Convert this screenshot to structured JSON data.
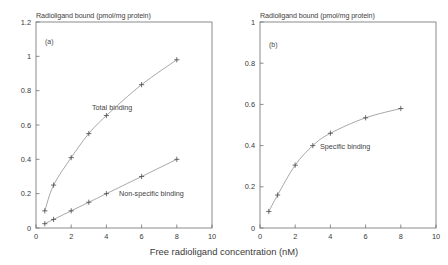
{
  "figure": {
    "xlabel": "Free radioligand concentration (nM)",
    "panels": [
      {
        "tag": "(a)",
        "ytitle": "Radioligand bound (pmol/mg protein)",
        "series_labels": [
          "Total binding",
          "Non-specific binding"
        ]
      },
      {
        "tag": "(b)",
        "ytitle": "Radioligand bound (pmol/mg protein)",
        "series_labels": [
          "Specific binding"
        ]
      }
    ]
  },
  "chart_data": [
    {
      "type": "line",
      "title": "Radioligand bound (pmol/mg protein)",
      "panel": "(a)",
      "xlabel": "Free radioligand concentration (nM)",
      "ylabel": "Radioligand bound (pmol/mg protein)",
      "xlim": [
        0,
        10
      ],
      "ylim": [
        0,
        1.2
      ],
      "xticks": [
        0,
        2,
        4,
        6,
        8,
        10
      ],
      "yticks": [
        0,
        0.2,
        0.4,
        0.6,
        0.8,
        1,
        1.2
      ],
      "xticklabels": [
        "0",
        "2",
        "4",
        "6",
        "8",
        "10"
      ],
      "yticklabels": [
        "0",
        "0.2",
        "0.4",
        "0.6",
        "0.8",
        "1",
        "1.2"
      ],
      "grid": false,
      "legend": "inline-annotation",
      "marker": "plus",
      "x": [
        0.5,
        1,
        2,
        3,
        4,
        6,
        8
      ],
      "series": [
        {
          "name": "Total binding",
          "values": [
            0.1,
            0.25,
            0.41,
            0.55,
            0.655,
            0.835,
            0.98
          ]
        },
        {
          "name": "Non-specific binding",
          "values": [
            0.025,
            0.05,
            0.1,
            0.15,
            0.2,
            0.3,
            0.4
          ]
        }
      ]
    },
    {
      "type": "line",
      "title": "Radioligand bound (pmol/mg protein)",
      "panel": "(b)",
      "xlabel": "Free radioligand concentration (nM)",
      "ylabel": "Radioligand bound (pmol/mg protein)",
      "xlim": [
        0,
        10
      ],
      "ylim": [
        0,
        1
      ],
      "xticks": [
        0,
        2,
        4,
        6,
        8,
        10
      ],
      "yticks": [
        0,
        0.2,
        0.4,
        0.6,
        0.8,
        1
      ],
      "xticklabels": [
        "0",
        "2",
        "4",
        "6",
        "8",
        "10"
      ],
      "yticklabels": [
        "0",
        "0.2",
        "0.4",
        "0.6",
        "0.8",
        "1"
      ],
      "grid": false,
      "legend": "inline-annotation",
      "marker": "plus",
      "x": [
        0.5,
        1,
        2,
        3,
        4,
        6,
        8
      ],
      "series": [
        {
          "name": "Specific binding",
          "values": [
            0.08,
            0.16,
            0.305,
            0.4,
            0.46,
            0.535,
            0.58
          ]
        }
      ]
    }
  ],
  "style": {
    "axis_color": "#6e6e6e",
    "line_color": "#8a8a8a",
    "marker_color": "#4a4a4a",
    "text_color": "#3a3a3a",
    "background": "#ffffff"
  }
}
